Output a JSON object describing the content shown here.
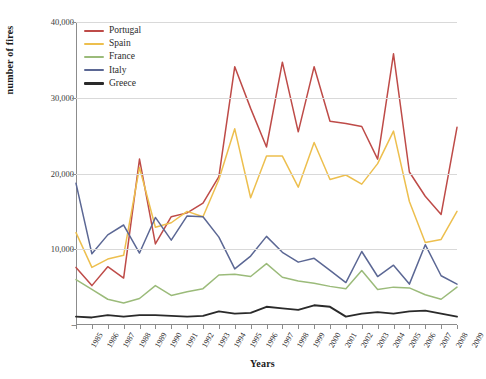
{
  "chart_data": {
    "type": "line",
    "title": "",
    "xlabel": "Years",
    "ylabel": "number of fires",
    "x": [
      1985,
      1986,
      1987,
      1988,
      1989,
      1990,
      1991,
      1992,
      1993,
      1994,
      1995,
      1996,
      1997,
      1998,
      1999,
      2000,
      2001,
      2002,
      2003,
      2004,
      2005,
      2006,
      2007,
      2008,
      2009
    ],
    "categories": [
      "1985",
      "1986",
      "1987",
      "1988",
      "1989",
      "1990",
      "1991",
      "1992",
      "1993",
      "1994",
      "1995",
      "1996",
      "1997",
      "1998",
      "1999",
      "2000",
      "2001",
      "2002",
      "2003",
      "2004",
      "2005",
      "2006",
      "2007",
      "2008",
      "2009"
    ],
    "ylim": [
      0,
      40000
    ],
    "xlim": [
      1985,
      2009
    ],
    "yticks": [
      0,
      10000,
      20000,
      30000,
      40000
    ],
    "ytick_labels": [
      "-",
      "10,000",
      "20,000",
      "30,000",
      "40,000"
    ],
    "grid": true,
    "legend_position": "top-left",
    "series": [
      {
        "name": "Portugal",
        "color": "#BE4B48",
        "values": [
          7600,
          5200,
          7700,
          6200,
          21900,
          10700,
          14300,
          14800,
          16100,
          19600,
          34100,
          28600,
          23500,
          34700,
          25500,
          34100,
          26900,
          26600,
          26200,
          21900,
          35800,
          20200,
          17000,
          14600,
          26100
        ]
      },
      {
        "name": "Spain",
        "color": "#EDBF4E",
        "values": [
          12200,
          7600,
          8700,
          9200,
          20800,
          12900,
          13500,
          15000,
          14300,
          19200,
          25900,
          16800,
          22300,
          22300,
          18200,
          24100,
          19200,
          19800,
          18600,
          21300,
          25600,
          16300,
          10900,
          11300,
          15000
        ]
      },
      {
        "name": "France",
        "color": "#9BBB7A",
        "values": [
          6000,
          4700,
          3400,
          2900,
          3500,
          5200,
          3900,
          4400,
          4800,
          6600,
          6700,
          6400,
          8100,
          6300,
          5800,
          5500,
          5100,
          4800,
          7200,
          4700,
          5000,
          4900,
          4000,
          3400,
          5000
        ]
      },
      {
        "name": "Italy",
        "color": "#5B6794",
        "values": [
          18700,
          9400,
          11900,
          13200,
          9500,
          14200,
          11200,
          14400,
          14300,
          11600,
          7400,
          9100,
          11700,
          9600,
          8300,
          8800,
          7200,
          5600,
          9700,
          6400,
          7900,
          5400,
          10600,
          6500,
          5400
        ]
      },
      {
        "name": "Greece",
        "color": "#2A2A2A",
        "values": [
          1100,
          1000,
          1300,
          1100,
          1300,
          1300,
          1200,
          1100,
          1200,
          1800,
          1500,
          1600,
          2400,
          2200,
          2000,
          2600,
          2400,
          1100,
          1500,
          1700,
          1500,
          1800,
          1900,
          1500,
          1100
        ]
      }
    ]
  },
  "axes": {
    "ylabel": "number of fires",
    "xlabel": "Years"
  }
}
